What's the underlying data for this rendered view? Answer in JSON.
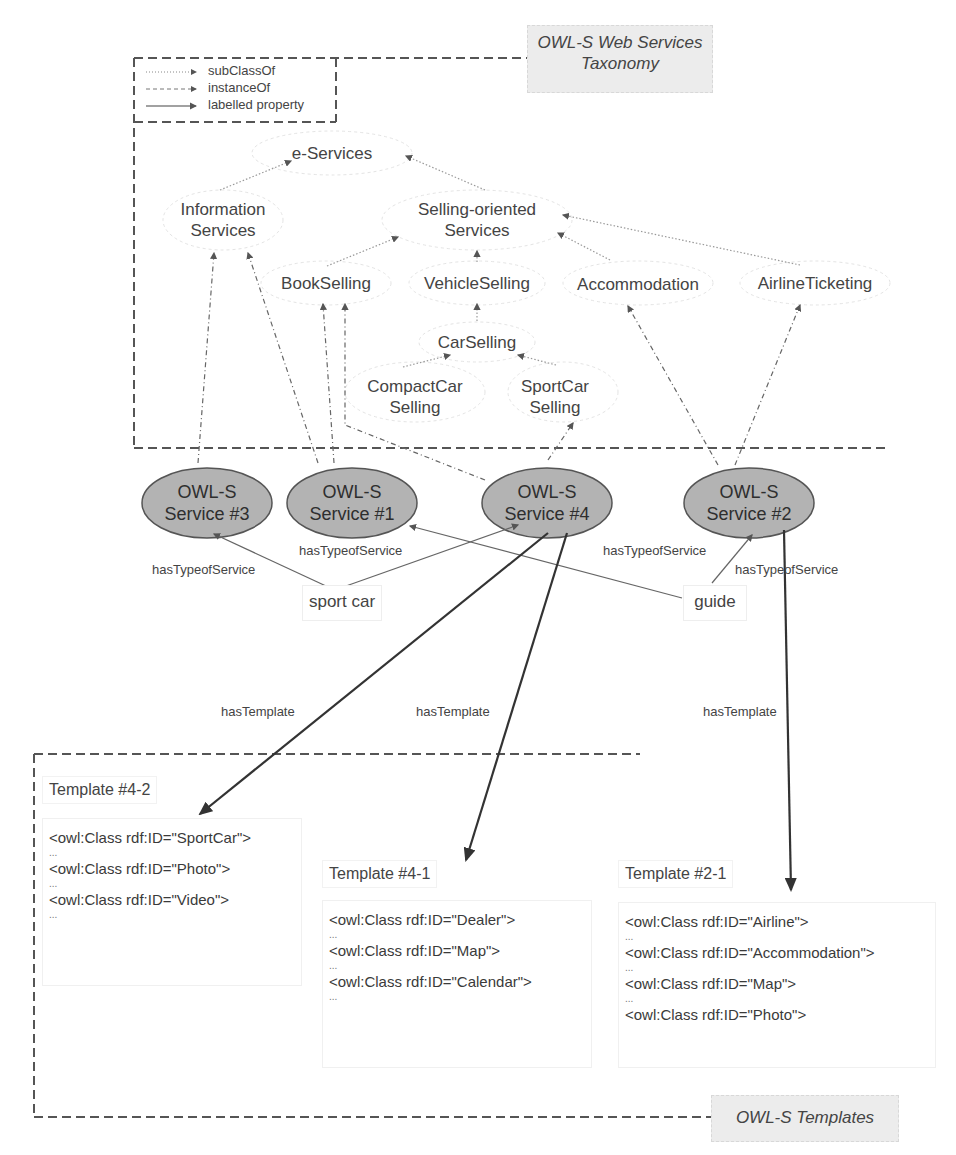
{
  "diagram": {
    "taxonomy_title": {
      "line1": "OWL-S Web Services",
      "line2": "Taxonomy"
    },
    "templates_title": "OWL-S Templates",
    "legend": [
      {
        "style": "dotted",
        "label": "subClassOf"
      },
      {
        "style": "dashdot",
        "label": "instanceOf"
      },
      {
        "style": "solid",
        "label": "labelled property"
      }
    ],
    "taxonomy_nodes": {
      "e_services": {
        "line1": "e-Services"
      },
      "information_services": {
        "line1": "Information",
        "line2": "Services"
      },
      "selling_oriented": {
        "line1": "Selling-oriented",
        "line2": "Services"
      },
      "book_selling": {
        "line1": "BookSelling"
      },
      "vehicle_selling": {
        "line1": "VehicleSelling"
      },
      "accommodation": {
        "line1": "Accommodation"
      },
      "airline_ticketing": {
        "line1": "AirlineTicketing"
      },
      "car_selling": {
        "line1": "CarSelling"
      },
      "compact_car_selling": {
        "line1": "CompactCar",
        "line2": "Selling"
      },
      "sport_car_selling": {
        "line1": "SportCar",
        "line2": "Selling"
      }
    },
    "services": {
      "s3": {
        "line1": "OWL-S",
        "line2": "Service #3"
      },
      "s1": {
        "line1": "OWL-S",
        "line2": "Service #1"
      },
      "s4": {
        "line1": "OWL-S",
        "line2": "Service #4"
      },
      "s2": {
        "line1": "OWL-S",
        "line2": "Service #2"
      }
    },
    "keywords": {
      "sport_car": "sport car",
      "guide": "guide"
    },
    "edge_labels": {
      "has_type_1": "hasTypeofService",
      "has_type_2": "hasTypeofService",
      "has_type_3": "hasTypeofService",
      "has_type_4": "hasTypeofService",
      "has_template_1": "hasTemplate",
      "has_template_2": "hasTemplate",
      "has_template_3": "hasTemplate"
    },
    "templates": {
      "t42": {
        "title": "Template #4-2",
        "lines": [
          "<owl:Class rdf:ID=\"SportCar\">",
          "...",
          "<owl:Class rdf:ID=\"Photo\">",
          "...",
          "<owl:Class rdf:ID=\"Video\">",
          "..."
        ]
      },
      "t41": {
        "title": "Template #4-1",
        "lines": [
          "<owl:Class rdf:ID=\"Dealer\">",
          "...",
          "<owl:Class rdf:ID=\"Map\">",
          "...",
          "<owl:Class rdf:ID=\"Calendar\">",
          "..."
        ]
      },
      "t21": {
        "title": "Template #2-1",
        "lines": [
          "<owl:Class rdf:ID=\"Airline\">",
          "...",
          "<owl:Class rdf:ID=\"Accommodation\">",
          "...",
          "<owl:Class rdf:ID=\"Map\">",
          "...",
          "<owl:Class rdf:ID=\"Photo\">"
        ]
      }
    },
    "colors": {
      "service_fill": "#b3b3b3",
      "service_stroke": "#555555",
      "dashed_border": "#555555",
      "title_box_bg": "#ececec"
    }
  }
}
